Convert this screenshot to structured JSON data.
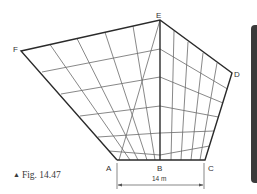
{
  "figure": {
    "caption_marker": "▲",
    "caption": "Fig. 14.47",
    "dimension_label": "14 m",
    "points": {
      "A": {
        "label": "A",
        "x": 117,
        "y": 160
      },
      "B": {
        "label": "B",
        "x": 160,
        "y": 160
      },
      "C": {
        "label": "C",
        "x": 205,
        "y": 160
      },
      "D": {
        "label": "D",
        "x": 232,
        "y": 73
      },
      "E": {
        "label": "E",
        "x": 160,
        "y": 20
      },
      "F": {
        "label": "F",
        "x": 21,
        "y": 51
      }
    },
    "colors": {
      "outline": "#2a2a2a",
      "grid": "#6a6a6a",
      "side_bar": "#3a3a3a"
    }
  }
}
